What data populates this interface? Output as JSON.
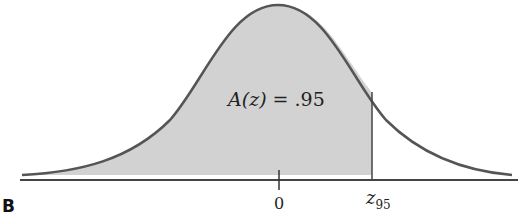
{
  "figure": {
    "label": "B",
    "area_label_prefix": "A(z) = ",
    "area_label_value": ".95",
    "zero_tick_label": "0",
    "z_label": "z",
    "z_subscript": "95",
    "colors": {
      "shade": "#d2d2d2",
      "curve": "#555555",
      "axis": "#444444"
    }
  }
}
